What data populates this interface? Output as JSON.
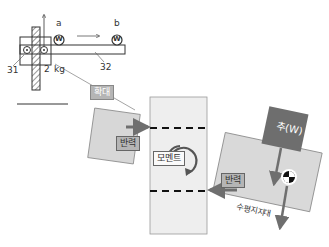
{
  "top_diagram": {
    "label_a": "a",
    "label_b": "b",
    "weight_a": "W",
    "weight_b": "W",
    "label_31": "31",
    "label_2": "2",
    "label_kg": "kg",
    "label_32": "32"
  },
  "zoom_label": "확대",
  "bottom_diagram": {
    "reaction_left": "반력",
    "moment": "모멘트",
    "weight_label": "추(W)",
    "reaction_right": "반력",
    "horizontal_support": "수평지지대"
  },
  "colors": {
    "panel_fill": "#d7d7d7",
    "column_fill": "#eeeeee",
    "weight_box": "#6e6e6e",
    "arrow": "#6f6f6f",
    "tag_fill": "#b5b5b5"
  }
}
